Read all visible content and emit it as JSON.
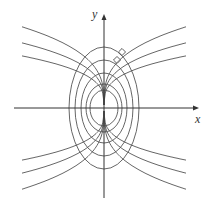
{
  "diagram": {
    "axes": {
      "x_label": "x",
      "y_label": "y",
      "origin_px": [
        104,
        108
      ],
      "x_range_px": [
        14,
        199
      ],
      "y_range_px": [
        14,
        198
      ]
    },
    "colors": {
      "stroke": "#555555",
      "axis": "#333333",
      "background": "#ffffff"
    },
    "ellipse_family": {
      "equation": "x^2 + y^2/3 = C",
      "semi_axes_px": [
        {
          "a": 14,
          "b": 18
        },
        {
          "a": 18,
          "b": 24
        },
        {
          "a": 23,
          "b": 35
        },
        {
          "a": 29,
          "b": 48
        },
        {
          "a": 35,
          "b": 61
        }
      ]
    },
    "trajectory_family": {
      "equation": "y = A·x^(1/3)",
      "coefficients_px": [
        11.3,
        14.3,
        18.0,
        -11.3,
        -14.3,
        -18.0
      ],
      "x_extent_px": 82,
      "inner_gap_px": 3
    },
    "right_angle_markers": [
      {
        "x": 122,
        "y": 52,
        "size": 5
      },
      {
        "x": 117,
        "y": 60,
        "size": 5
      }
    ]
  }
}
